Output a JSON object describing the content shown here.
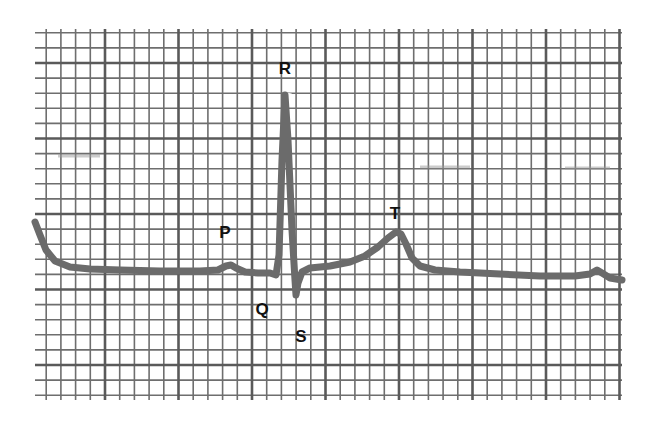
{
  "figure": {
    "colors": {
      "background": "#ffffff",
      "grid_minor": "#6e6e6e",
      "grid_major": "#5a5a5a",
      "trace": "#6b6b6b",
      "label": "#111111"
    },
    "grid": {
      "left": 35,
      "top": 29,
      "right": 622,
      "bottom": 400,
      "minor_spacing_x": 14.7,
      "minor_spacing_y": 15.1,
      "major_every": 5,
      "first_major_x": 105,
      "first_major_y": 63
    },
    "labels": [
      {
        "id": "P",
        "text": "P",
        "x": 225,
        "y": 238
      },
      {
        "id": "Q",
        "text": "Q",
        "x": 262,
        "y": 315
      },
      {
        "id": "R",
        "text": "R",
        "x": 285,
        "y": 74
      },
      {
        "id": "S",
        "text": "S",
        "x": 301,
        "y": 342
      },
      {
        "id": "T",
        "text": "T",
        "x": 395,
        "y": 219
      }
    ],
    "waves": {
      "P": {
        "peak_x": 230,
        "peak_y": 265
      },
      "Q": {
        "trough_x": 276,
        "trough_y": 275
      },
      "R": {
        "peak_x": 285,
        "peak_y": 95
      },
      "S": {
        "trough_x": 296,
        "trough_y": 295
      },
      "T": {
        "peak_x": 397,
        "peak_y": 232
      }
    }
  },
  "chart_data": {
    "type": "line",
    "title": "",
    "xlabel": "",
    "ylabel": "",
    "grid": true,
    "annotations": [
      "P",
      "Q",
      "R",
      "S",
      "T"
    ],
    "points": [
      [
        35,
        222
      ],
      [
        40,
        235
      ],
      [
        46,
        250
      ],
      [
        55,
        261
      ],
      [
        70,
        267
      ],
      [
        90,
        269
      ],
      [
        120,
        270
      ],
      [
        160,
        271
      ],
      [
        200,
        271
      ],
      [
        218,
        270
      ],
      [
        226,
        266
      ],
      [
        231,
        265
      ],
      [
        236,
        268
      ],
      [
        245,
        272
      ],
      [
        258,
        273
      ],
      [
        270,
        273
      ],
      [
        276,
        275
      ],
      [
        279,
        255
      ],
      [
        282,
        160
      ],
      [
        285,
        95
      ],
      [
        288,
        140
      ],
      [
        292,
        230
      ],
      [
        295,
        280
      ],
      [
        296,
        295
      ],
      [
        298,
        283
      ],
      [
        302,
        272
      ],
      [
        310,
        268
      ],
      [
        330,
        266
      ],
      [
        350,
        262
      ],
      [
        365,
        256
      ],
      [
        378,
        247
      ],
      [
        388,
        238
      ],
      [
        396,
        232
      ],
      [
        401,
        234
      ],
      [
        406,
        244
      ],
      [
        412,
        258
      ],
      [
        420,
        266
      ],
      [
        435,
        270
      ],
      [
        460,
        272
      ],
      [
        500,
        274
      ],
      [
        540,
        276
      ],
      [
        575,
        276
      ],
      [
        590,
        274
      ],
      [
        597,
        270
      ],
      [
        602,
        273
      ],
      [
        610,
        278
      ],
      [
        622,
        280
      ]
    ]
  }
}
